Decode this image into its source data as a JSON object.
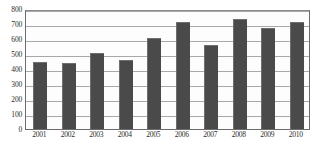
{
  "chart_data": {
    "type": "bar",
    "title": "",
    "subtitle": "",
    "xlabel": "",
    "ylabel": "",
    "categories": [
      "2001",
      "2002",
      "2003",
      "2004",
      "2005",
      "2006",
      "2007",
      "2008",
      "2009",
      "2010"
    ],
    "values": [
      447,
      443,
      510,
      458,
      604,
      713,
      560,
      733,
      673,
      715
    ],
    "series": [
      {
        "name": "",
        "values": [
          447,
          443,
          510,
          458,
          604,
          713,
          560,
          733,
          673,
          715
        ]
      }
    ],
    "ylim": [
      0,
      800
    ],
    "yticks": [
      0,
      100,
      200,
      300,
      400,
      500,
      600,
      700,
      800
    ],
    "ytick_labels": [
      "0",
      "100",
      "200",
      "300",
      "400",
      "500",
      "600",
      "700",
      "800"
    ],
    "grid": true,
    "grid_axis": "y",
    "legend": false,
    "legend_position": "none",
    "annotations": [],
    "colors": {
      "bar_fill": "#4a4a4a",
      "bar_edge": "#6e6e6e",
      "gridline": "#a8a8a8",
      "frame": "#6b6b6b",
      "plot_background": "#fdfdfd",
      "page_background": "#ffffff",
      "text": "#2b2b2b"
    }
  },
  "caption": {
    "clipped_text": ""
  }
}
